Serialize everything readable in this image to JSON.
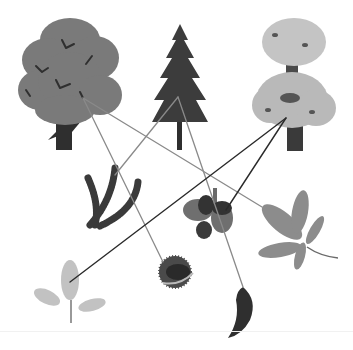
{
  "caption_fragment": "· ·  ·· ·",
  "colors": {
    "background": "#ffffff",
    "line_gray": "#8a8a8a",
    "line_dark": "#2a2a2a",
    "oak_canopy": "#7a7a7a",
    "trunk": "#2f2f2f",
    "fir": "#3c3c3c",
    "chestnut_canopy": "#b9b9b9",
    "leaf_light": "#c2c2c2",
    "leaf_mid": "#8c8c8c",
    "dark_fruit": "#3a3a3a"
  },
  "trees": [
    {
      "id": "oak-tree",
      "label": "Oak tree",
      "anchor": [
        83,
        98
      ]
    },
    {
      "id": "fir-tree",
      "label": "Fir tree",
      "anchor": [
        178,
        97
      ]
    },
    {
      "id": "chestnut-tree",
      "label": "Horse chestnut tree",
      "anchor": [
        286,
        118
      ]
    }
  ],
  "items": [
    {
      "id": "fir-branch",
      "label": "Fir branch",
      "pos": [
        115,
        195
      ]
    },
    {
      "id": "acorns",
      "label": "Acorns",
      "pos": [
        210,
        215
      ]
    },
    {
      "id": "chestnut-leaf",
      "label": "Horse chestnut leaf",
      "pos": [
        290,
        225
      ]
    },
    {
      "id": "oak-leaf",
      "label": "Oak leaf",
      "pos": [
        70,
        290
      ]
    },
    {
      "id": "conker",
      "label": "Conker",
      "pos": [
        175,
        270
      ]
    },
    {
      "id": "pine-cone",
      "label": "Fir cone",
      "pos": [
        243,
        310
      ]
    }
  ],
  "connections": [
    {
      "from": "oak-tree",
      "to": "conker",
      "x1": 83,
      "y1": 98,
      "x2": 163,
      "y2": 262,
      "style": "gray"
    },
    {
      "from": "oak-tree",
      "to": "chestnut-leaf",
      "x1": 83,
      "y1": 98,
      "x2": 262,
      "y2": 207,
      "style": "gray"
    },
    {
      "from": "fir-tree",
      "to": "fir-branch",
      "x1": 178,
      "y1": 97,
      "x2": 115,
      "y2": 175,
      "style": "gray"
    },
    {
      "from": "fir-tree",
      "to": "pine-cone",
      "x1": 178,
      "y1": 97,
      "x2": 243,
      "y2": 287,
      "style": "gray"
    },
    {
      "from": "chestnut-tree",
      "to": "oak-leaf",
      "x1": 286,
      "y1": 118,
      "x2": 70,
      "y2": 282,
      "style": "dark"
    },
    {
      "from": "chestnut-tree",
      "to": "acorns",
      "x1": 286,
      "y1": 118,
      "x2": 226,
      "y2": 210,
      "style": "dark"
    }
  ]
}
